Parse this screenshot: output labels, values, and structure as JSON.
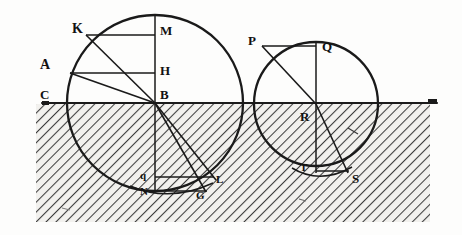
{
  "figure": {
    "background_color": "#fdfdfc",
    "ink_color": "#1a1a1a",
    "hatch_color": "#4a4a4a",
    "ground": {
      "name": "ground-line",
      "y": 103,
      "x_start": 42,
      "x_end": 437,
      "hatch_left": 36,
      "hatch_right": 430,
      "hatch_bottom": 222
    },
    "left_circle": {
      "name": "left-circle",
      "center_label": "B",
      "cx": 155,
      "cy": 103,
      "r": 88
    },
    "right_circle": {
      "name": "right-circle",
      "center_label": "R",
      "cx": 316,
      "cy": 104,
      "r": 62
    },
    "labels": [
      {
        "id": "label-K",
        "text": "K",
        "x": 72,
        "y": 22,
        "style": "lbl-cap-bold"
      },
      {
        "id": "label-M",
        "text": "M",
        "x": 160,
        "y": 24,
        "style": "lbl-cap"
      },
      {
        "id": "label-A",
        "text": "A",
        "x": 40,
        "y": 58,
        "style": "lbl-cap-bold"
      },
      {
        "id": "label-H",
        "text": "H",
        "x": 160,
        "y": 64,
        "style": "lbl-cap"
      },
      {
        "id": "label-C",
        "text": "C",
        "x": 40,
        "y": 88,
        "style": "lbl-cap"
      },
      {
        "id": "label-B",
        "text": "B",
        "x": 160,
        "y": 88,
        "style": "lbl-cap"
      },
      {
        "id": "label-q",
        "text": "q",
        "x": 140,
        "y": 170,
        "style": "lbl-small"
      },
      {
        "id": "label-N",
        "text": "N",
        "x": 140,
        "y": 186,
        "style": "lbl-small"
      },
      {
        "id": "label-L",
        "text": "L",
        "x": 216,
        "y": 174,
        "style": "lbl-small"
      },
      {
        "id": "label-G",
        "text": "G",
        "x": 196,
        "y": 190,
        "style": "lbl-small"
      },
      {
        "id": "label-P",
        "text": "P",
        "x": 248,
        "y": 34,
        "style": "lbl-cap"
      },
      {
        "id": "label-Q",
        "text": "Q",
        "x": 322,
        "y": 40,
        "style": "lbl-cap"
      },
      {
        "id": "label-R",
        "text": "R",
        "x": 300,
        "y": 110,
        "style": "lbl-cap"
      },
      {
        "id": "label-T",
        "text": "T",
        "x": 300,
        "y": 162,
        "style": "lbl-small"
      },
      {
        "id": "label-S",
        "text": "S",
        "x": 352,
        "y": 172,
        "style": "lbl-cap"
      }
    ],
    "left_points": {
      "K": {
        "x": 86,
        "y": 35
      },
      "M": {
        "x": 155,
        "y": 35
      },
      "A": {
        "x": 70,
        "y": 73
      },
      "H": {
        "x": 155,
        "y": 73
      },
      "C": {
        "x": 68,
        "y": 103
      },
      "B": {
        "x": 155,
        "y": 103
      },
      "top": {
        "x": 155,
        "y": 15
      },
      "q": {
        "x": 155,
        "y": 177
      },
      "N": {
        "x": 155,
        "y": 191
      },
      "L": {
        "x": 213,
        "y": 180
      },
      "G": {
        "x": 206,
        "y": 192
      }
    },
    "right_points": {
      "P": {
        "x": 262,
        "y": 46
      },
      "Q": {
        "x": 316,
        "y": 46
      },
      "R": {
        "x": 316,
        "y": 104
      },
      "T": {
        "x": 316,
        "y": 171
      },
      "S": {
        "x": 347,
        "y": 176
      },
      "top": {
        "x": 316,
        "y": 42
      }
    }
  }
}
